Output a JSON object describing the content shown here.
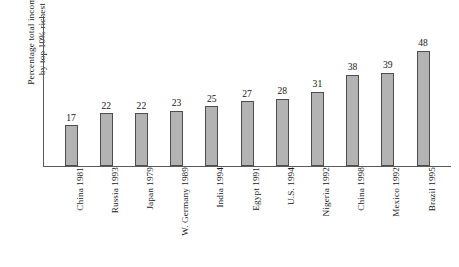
{
  "chart_data": {
    "type": "bar",
    "title": "",
    "xlabel": "",
    "ylabel": "Percentage total income by top 10% richest",
    "ylabel_lines": [
      "Percentage total income",
      "by top 10% richest"
    ],
    "categories": [
      "China 1981",
      "Russia 1993",
      "Japan 1979",
      "W. Germany 1989",
      "India 1994",
      "Egypt 1991",
      "U.S. 1994",
      "Nigeria 1992",
      "China 1998",
      "Mexico 1992",
      "Brazil 1995"
    ],
    "values": [
      17,
      22,
      22,
      23,
      25,
      27,
      28,
      31,
      38,
      39,
      48
    ],
    "value_labels": [
      "17",
      "22",
      "22",
      "23",
      "25",
      "27",
      "28",
      "31",
      "38",
      "39",
      "48"
    ],
    "ylim": [
      0,
      48
    ],
    "grid": false,
    "legend": null,
    "tick_labels_y": [],
    "colors": {
      "bar_fill": "#b3b3b3",
      "bar_border": "#4d4d4d",
      "axis": "#5a5a5a",
      "text": "#161616",
      "background": "#ffffff"
    }
  }
}
